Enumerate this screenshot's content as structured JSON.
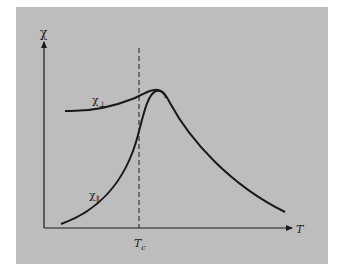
{
  "figure": {
    "y_axis_label": "χ",
    "x_axis_label": "T",
    "critical_temperature_label": "T",
    "critical_temperature_subscript": "c",
    "curves": [
      {
        "name": "chi-perpendicular",
        "label": "χ",
        "subscript": "⊥"
      },
      {
        "name": "chi-parallel",
        "label": "χ",
        "subscript": "∥"
      }
    ],
    "colors": {
      "panel": "#bdbdbd",
      "ink": "#1a1a1a",
      "background": "#ffffff"
    }
  }
}
